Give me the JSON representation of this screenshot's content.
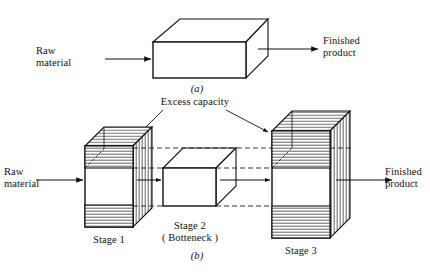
{
  "figure": {
    "title_a": "(a)",
    "title_b": "(b)",
    "panel_a": {
      "input_label_line1": "Raw",
      "input_label_line2": "material",
      "output_label_line1": "Finished",
      "output_label_line2": "product"
    },
    "panel_b": {
      "callout_label": "Excess capacity",
      "input_label_line1": "Raw",
      "input_label_line2": "material",
      "output_label_line1": "Finished",
      "output_label_line2": "product",
      "stages": [
        {
          "name": "Stage 1",
          "sub": ""
        },
        {
          "name": "Stage 2",
          "sub": "( Botteneck )"
        },
        {
          "name": "Stage 3",
          "sub": ""
        }
      ]
    }
  },
  "colors": {
    "ink": "#111111",
    "paper": "#ffffff",
    "hatch": "#3a3a3a",
    "dashed": "#222222"
  }
}
